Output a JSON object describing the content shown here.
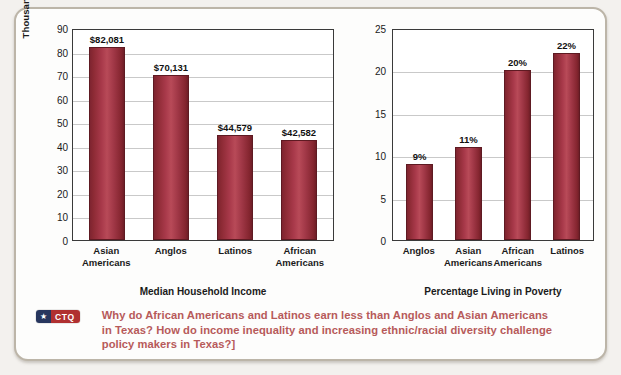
{
  "figure": {
    "caption_badge": {
      "star": "★",
      "label": "CTQ"
    },
    "caption_text": "Why do African Americans and Latinos earn less than Anglos and Asian Americans in Texas? How do income inequality and increasing ethnic/racial diversity challenge policy makers in Texas?]"
  },
  "chart_data": [
    {
      "type": "bar",
      "id": "median-household-income",
      "title": "Median Household Income",
      "xlabel": "",
      "ylabel": "Thousands of 2016 Dollars",
      "ylim": [
        0,
        90
      ],
      "ytick_step": 10,
      "yticks": [
        "90",
        "80",
        "70",
        "60",
        "50",
        "40",
        "30",
        "20",
        "10",
        "0"
      ],
      "grid": true,
      "legend": "none",
      "bar_color": "#a8394a",
      "categories": [
        {
          "line1": "Asian",
          "line2": "Americans"
        },
        {
          "line1": "Anglos",
          "line2": ""
        },
        {
          "line1": "Latinos",
          "line2": ""
        },
        {
          "line1": "African",
          "line2": "Americans"
        }
      ],
      "values": [
        82.081,
        70.131,
        44.579,
        42.582
      ],
      "data_labels": [
        "$82,081",
        "$70,131",
        "$44,579",
        "$42,582"
      ]
    },
    {
      "type": "bar",
      "id": "percentage-living-in-poverty",
      "title": "Percentage Living in Poverty",
      "xlabel": "",
      "ylabel": "",
      "ylim": [
        0,
        25
      ],
      "ytick_step": 5,
      "yticks": [
        "25",
        "20",
        "15",
        "10",
        "5",
        "0"
      ],
      "grid": true,
      "legend": "none",
      "bar_color": "#a8394a",
      "categories": [
        {
          "line1": "Anglos",
          "line2": ""
        },
        {
          "line1": "Asian",
          "line2": "Americans"
        },
        {
          "line1": "African",
          "line2": "Americans"
        },
        {
          "line1": "Latinos",
          "line2": ""
        }
      ],
      "values": [
        9,
        11,
        20,
        22
      ],
      "data_labels": [
        "9%",
        "11%",
        "20%",
        "22%"
      ]
    }
  ]
}
